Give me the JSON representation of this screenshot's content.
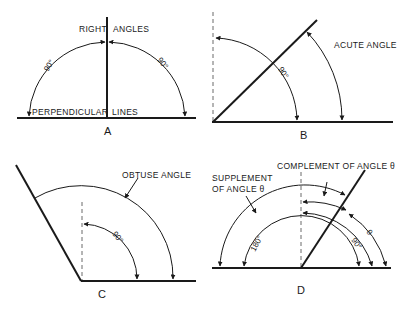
{
  "figure": {
    "panels": [
      {
        "id": "A",
        "label": "A",
        "annotations": [
          "RIGHT",
          "ANGLES",
          "PERPENDICULAR",
          "LINES"
        ],
        "angle_labels": [
          "90°",
          "90°"
        ]
      },
      {
        "id": "B",
        "label": "B",
        "annotations": [
          "ACUTE ANGLE"
        ],
        "angle_labels": [
          "90°"
        ]
      },
      {
        "id": "C",
        "label": "C",
        "annotations": [
          "OBTUSE ANGLE"
        ],
        "angle_labels": [
          "90°"
        ]
      },
      {
        "id": "D",
        "label": "D",
        "annotations": [
          "COMPLEMENT OF ANGLE θ",
          "SUPPLEMENT",
          "OF ANGLE θ"
        ],
        "angle_labels": [
          "180°",
          "90°",
          "θ"
        ]
      }
    ]
  }
}
